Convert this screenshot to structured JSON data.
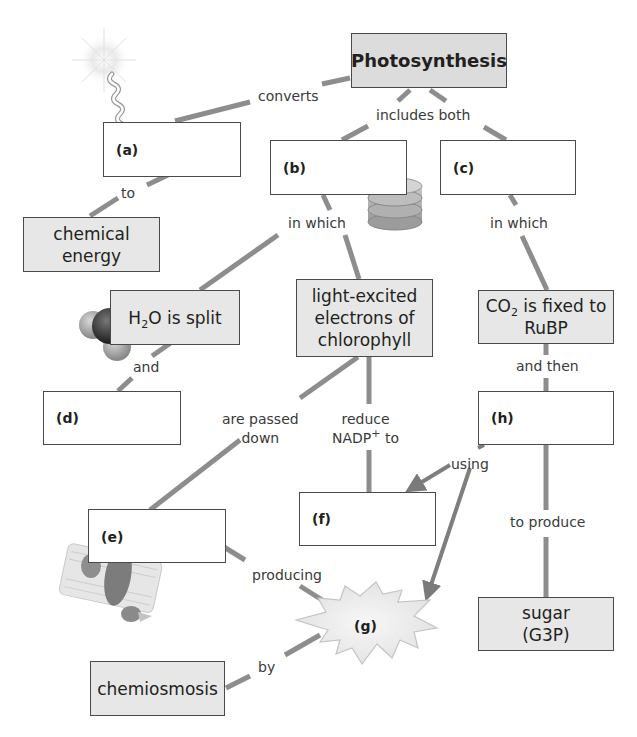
{
  "colors": {
    "connector": "#8a8a8a",
    "filled_box": "#e7e7e7",
    "title_box": "#dcdcdc",
    "blank_box": "#ffffff",
    "border": "#4a4a4a",
    "starburst": "#ececec"
  },
  "top_cropped_text": "",
  "nodes": {
    "photosynthesis": "Photosynthesis",
    "chemical_energy_1": "chemical",
    "chemical_energy_2": "energy",
    "h2o_prefix": "H",
    "h2o_sub": "2",
    "h2o_suffix": "O is split",
    "electrons_1": "light-excited",
    "electrons_2": "electrons of",
    "electrons_3": "chlorophyll",
    "co2_prefix": "CO",
    "co2_sub": "2",
    "co2_suffix": " is fixed to",
    "co2_line2": "RuBP",
    "sugar_1": "sugar",
    "sugar_2": "(G3P)",
    "chemiosmosis": "chemiosmosis"
  },
  "blanks": {
    "a": "(a)",
    "b": "(b)",
    "c": "(c)",
    "d": "(d)",
    "e": "(e)",
    "f": "(f)",
    "g": "(g)",
    "h": "(h)"
  },
  "links": {
    "converts": "converts",
    "includes_both": "includes both",
    "to": "to",
    "in_which_left": "in which",
    "in_which_right": "in which",
    "and": "and",
    "and_then": "and then",
    "are_passed_1": "are passed",
    "are_passed_2": "down",
    "reduce_1": "reduce",
    "reduce_nadp": "NADP",
    "reduce_sup": "+",
    "reduce_to": " to",
    "using": "using",
    "to_produce": "to produce",
    "producing": "producing",
    "by": "by"
  },
  "icons": [
    "sunlight-icon",
    "thylakoid-stack-icon",
    "water-molecule-icon",
    "membrane-protein-icon"
  ]
}
